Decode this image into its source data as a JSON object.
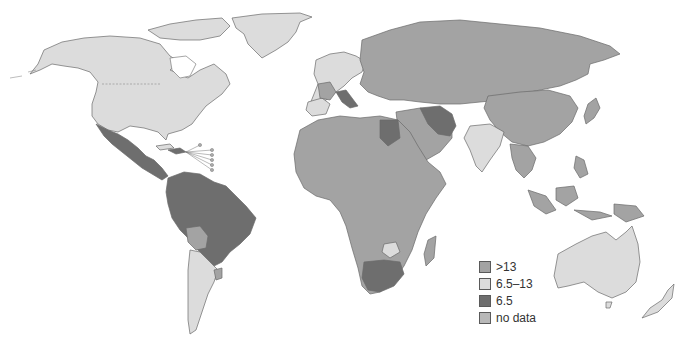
{
  "colors": {
    "gt13": "#a3a3a3",
    "mid": "#dcdcdc",
    "low": "#6e6e6e",
    "nodata": "#b8b8b8",
    "border": "#6a6a6a"
  },
  "legend": {
    "items": [
      {
        "key": "gt13",
        "label": ">13",
        "color": "#a3a3a3"
      },
      {
        "key": "mid",
        "label": "6.5–13",
        "color": "#dcdcdc"
      },
      {
        "key": "low",
        "label": "6.5",
        "color": "#6e6e6e"
      },
      {
        "key": "nodata",
        "label": "no data",
        "color": "#b8b8b8"
      }
    ]
  },
  "regions": {
    "north_america": "6.5–13",
    "greenland": "6.5–13",
    "mexico_central_america": "6.5",
    "northern_south_america_brazil": "6.5",
    "bolivia": ">13",
    "argentina_chile": "6.5–13",
    "western_europe": "6.5–13",
    "russia_central_asia": ">13",
    "china": ">13",
    "india": "6.5–13",
    "iran": "6.5",
    "egypt": "6.5",
    "africa": ">13",
    "south_africa": "6.5",
    "zimbabwe": "6.5–13",
    "southeast_asia": ">13",
    "australia": "6.5–13",
    "new_zealand": "6.5–13"
  }
}
